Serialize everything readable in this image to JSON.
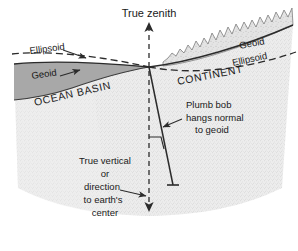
{
  "figure": {
    "background_color": "#ffffff"
  },
  "colors": {
    "line": "#2b2b2b",
    "ocean_fill": "#a9a9a9",
    "earth_fill": "#e8e8e8",
    "mountain_fill": "#dcdcdc",
    "text": "#1a1a1a",
    "dash": "#2b2b2b"
  },
  "labels": {
    "true_zenith": "True zenith",
    "ellipsoid_left": "Ellipsoid",
    "geoid_left": "Geoid",
    "geoid_right": "Geoid",
    "ellipsoid_right": "Ellipsoid",
    "continent": "CONTINENT",
    "ocean_basin": "OCEAN BASIN",
    "plumb_bob_line1": "Plumb bob",
    "plumb_bob_line2": "hangs normal",
    "plumb_bob_line3": "to geoid",
    "true_vertical_line1": "True vertical",
    "true_vertical_line2": "or",
    "true_vertical_line3": "direction",
    "true_vertical_line4": "to earth's",
    "true_vertical_line5": "center"
  },
  "annotations": {
    "zenith_arrow": "upward-arrow",
    "nadir_arrow": "downward-arrow",
    "ellipsoid_left_arrow": "pointer-arrow",
    "geoid_left_arrow": "pointer-arrow",
    "plumb_bob_arrow": "pointer-arrow",
    "true_vertical_arrow": "pointer-arrow",
    "right_angle_tick": "perpendicular-tick"
  }
}
